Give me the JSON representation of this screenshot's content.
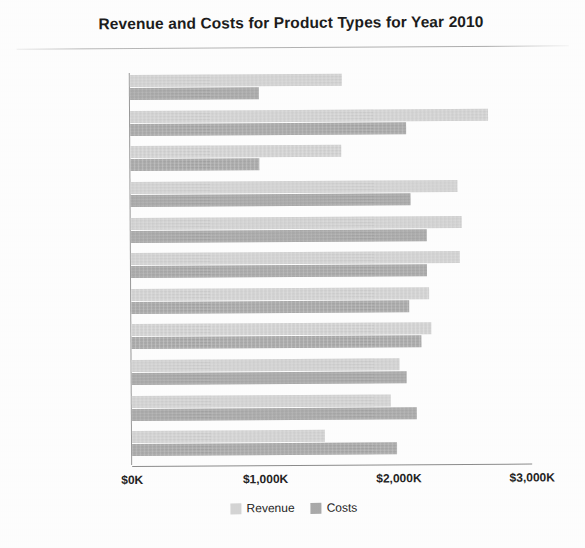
{
  "chart_data": {
    "type": "bar",
    "orientation": "horizontal",
    "title": "Revenue and Costs for Product Types for Year 2010",
    "xlabel": "",
    "ylabel": "",
    "xlim": [
      0,
      3000
    ],
    "grid": false,
    "legend_position": "bottom-center",
    "tick_labels": [
      "$0K",
      "$1,000K",
      "$2,000K",
      "$3,000K"
    ],
    "tick_values": [
      0,
      1000,
      2000,
      3000
    ],
    "categories": [
      "Install",
      "Fixed",
      "Maintenance",
      "LCD",
      "Audio",
      "Camera",
      "Smart Phones",
      "Plasma",
      "Portable",
      "Cell Phones",
      "Accessories"
    ],
    "series": [
      {
        "name": "Revenue",
        "color": "#d6d6d6",
        "values": [
          1590,
          2685,
          1580,
          2455,
          2480,
          2465,
          2235,
          2250,
          2010,
          1945,
          1450
        ]
      },
      {
        "name": "Costs",
        "color": "#ababab",
        "values": [
          965,
          2070,
          965,
          2100,
          2220,
          2220,
          2085,
          2175,
          2060,
          2135,
          1985
        ]
      }
    ]
  },
  "legend": {
    "items": [
      {
        "label": "Revenue",
        "swatch": "revenue-swatch"
      },
      {
        "label": "Costs",
        "swatch": "costs-swatch"
      }
    ]
  }
}
